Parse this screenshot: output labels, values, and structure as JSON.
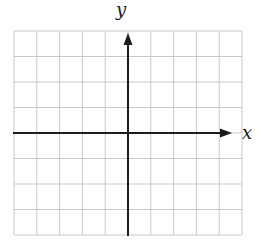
{
  "figure": {
    "background": "#ffffff",
    "grid": {
      "columns": 10,
      "rows": 8,
      "color": "#c9c9c9"
    },
    "axes": {
      "color": "#1c1c1c",
      "x_label": "x",
      "y_label": "y"
    }
  },
  "chart_data": {
    "type": "scatter",
    "title": "",
    "xlabel": "x",
    "ylabel": "y",
    "series": [],
    "grid": "on",
    "xlim": [
      -5,
      5
    ],
    "ylim": [
      -4,
      4
    ],
    "gridline_spacing": 1,
    "legend": "none",
    "annotations": []
  }
}
